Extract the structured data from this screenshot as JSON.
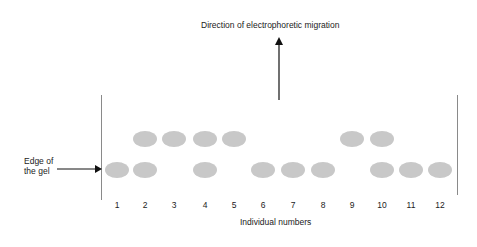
{
  "title": "Direction of electrophoretic migration",
  "edge_label": [
    "Edge of",
    "the gel"
  ],
  "x_label": "Individual numbers",
  "colors": {
    "band": "#c8c8c8",
    "line": "#8a8a8a",
    "arrow": "#111111"
  },
  "lanes": [
    {
      "n": "1",
      "x": 117,
      "upper": false,
      "lower": true
    },
    {
      "n": "2",
      "x": 145,
      "upper": true,
      "lower": true
    },
    {
      "n": "3",
      "x": 174,
      "upper": true,
      "lower": false
    },
    {
      "n": "4",
      "x": 205,
      "upper": true,
      "lower": true
    },
    {
      "n": "5",
      "x": 234,
      "upper": true,
      "lower": false
    },
    {
      "n": "6",
      "x": 263,
      "upper": false,
      "lower": true
    },
    {
      "n": "7",
      "x": 293,
      "upper": false,
      "lower": true
    },
    {
      "n": "8",
      "x": 323,
      "upper": false,
      "lower": true
    },
    {
      "n": "9",
      "x": 352,
      "upper": true,
      "lower": false
    },
    {
      "n": "10",
      "x": 382,
      "upper": true,
      "lower": true
    },
    {
      "n": "11",
      "x": 411,
      "upper": false,
      "lower": true
    },
    {
      "n": "12",
      "x": 440,
      "upper": false,
      "lower": true
    }
  ]
}
